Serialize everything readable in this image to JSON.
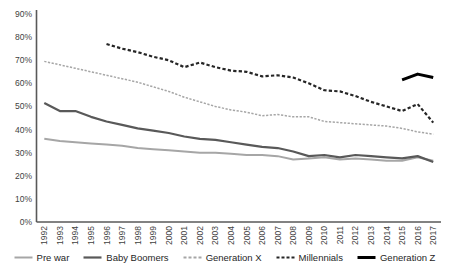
{
  "chart_data": {
    "type": "line",
    "title": "",
    "subtitle": "",
    "xlabel": "",
    "ylabel": "",
    "ylim": [
      0,
      90
    ],
    "ytick_labels": [
      "0%",
      "10%",
      "20%",
      "30%",
      "40%",
      "50%",
      "60%",
      "70%",
      "80%",
      "90%"
    ],
    "ytick_values": [
      0,
      10,
      20,
      30,
      40,
      50,
      60,
      70,
      80,
      90
    ],
    "grid": false,
    "legend_position": "bottom",
    "x": [
      1992,
      1993,
      1994,
      1995,
      1996,
      1997,
      1998,
      1999,
      2000,
      2001,
      2002,
      2003,
      2004,
      2005,
      2006,
      2007,
      2008,
      2009,
      2010,
      2011,
      2012,
      2013,
      2014,
      2015,
      2016,
      2017
    ],
    "xtick_labels": [
      "1992",
      "1993",
      "1994",
      "1995",
      "1996",
      "1997",
      "1998",
      "1999",
      "2000",
      "2001",
      "2002",
      "2003",
      "2004",
      "2005",
      "2006",
      "2007",
      "2008",
      "2009",
      "2010",
      "2011",
      "2012",
      "2013",
      "2014",
      "2015",
      "2016",
      "2017"
    ],
    "series": [
      {
        "name": "Pre war",
        "color": "#a6a6a6",
        "style": "solid",
        "width": 2.0,
        "values": [
          36,
          35,
          34.5,
          34,
          33.5,
          33,
          32,
          31.5,
          31,
          30.5,
          30,
          30,
          29.5,
          29,
          29,
          28.5,
          27,
          27.5,
          28,
          27,
          27.5,
          27,
          26.5,
          26.5,
          28,
          26.5
        ]
      },
      {
        "name": "Baby Boomers",
        "color": "#595959",
        "style": "solid",
        "width": 2.2,
        "values": [
          51.5,
          48,
          48,
          45.5,
          43.5,
          42,
          40.5,
          39.5,
          38.5,
          37,
          36,
          35.5,
          34.5,
          33.5,
          32.5,
          32,
          30.5,
          28.5,
          29,
          28,
          29,
          28.5,
          28,
          27.5,
          28.5,
          26
        ]
      },
      {
        "name": "Generation X",
        "color": "#a6a6a6",
        "style": "dashed",
        "width": 1.5,
        "values": [
          69.5,
          68,
          66.5,
          65,
          63.5,
          62,
          60.5,
          58.5,
          56.5,
          54,
          52,
          50,
          48.5,
          47.5,
          46,
          46.5,
          45.5,
          45.5,
          43.5,
          43,
          42.5,
          42,
          41.5,
          40.5,
          39,
          38
        ]
      },
      {
        "name": "Millennials",
        "color": "#262626",
        "style": "dashed",
        "width": 2.2,
        "values": [
          null,
          null,
          null,
          null,
          77,
          75,
          73.5,
          71.5,
          70,
          67,
          69,
          67,
          65.5,
          65,
          63,
          63.5,
          62.5,
          60,
          57,
          56.5,
          54.5,
          52,
          50,
          48,
          51,
          43
        ]
      },
      {
        "name": "Generation Z",
        "color": "#000000",
        "style": "solid",
        "width": 3.0,
        "values": [
          null,
          null,
          null,
          null,
          null,
          null,
          null,
          null,
          null,
          null,
          null,
          null,
          null,
          null,
          null,
          null,
          null,
          null,
          null,
          null,
          null,
          null,
          null,
          61.5,
          64,
          62.5
        ]
      }
    ]
  },
  "legend": {
    "items": [
      {
        "label": "Pre war"
      },
      {
        "label": "Baby Boomers"
      },
      {
        "label": "Generation X"
      },
      {
        "label": "Millennials"
      },
      {
        "label": "Generation Z"
      }
    ]
  }
}
